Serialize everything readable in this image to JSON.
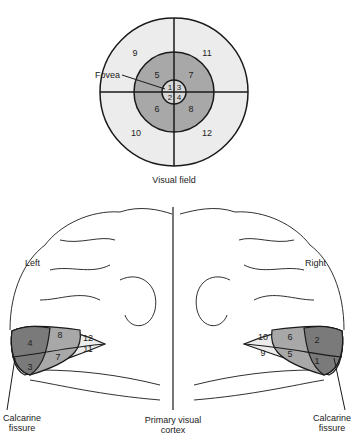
{
  "visual_field": {
    "title": "Visual field",
    "fovea_label": "Fovea",
    "sectors": [
      "1",
      "2",
      "3",
      "4",
      "5",
      "6",
      "7",
      "8",
      "9",
      "10",
      "11",
      "12"
    ]
  },
  "cortex": {
    "left_label": "Left",
    "right_label": "Right",
    "center_label_line1": "Primary visual",
    "center_label_line2": "cortex",
    "left_fissure_line1": "Calcarine",
    "left_fissure_line2": "fissure",
    "right_fissure_line1": "Calcarine",
    "right_fissure_line2": "fissure"
  },
  "colors": {
    "outer_ring": "#ececec",
    "middle_ring": "#a8a8a8",
    "inner_ring": "#d8d8d8",
    "dark_region": "#7a7a7a",
    "line": "#1a1a1a"
  }
}
